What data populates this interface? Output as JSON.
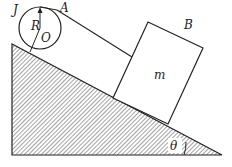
{
  "labels": {
    "J": "J",
    "R": "R",
    "O": "O",
    "A": "A",
    "B": "B",
    "m": "m",
    "theta": "θ"
  },
  "colors": {
    "line": "#222222",
    "hatch": "#333333",
    "background": "#ffffff"
  },
  "geometry": {
    "incline": {
      "top": [
        12,
        44
      ],
      "bottom_left": [
        12,
        155
      ],
      "right": [
        222,
        155
      ]
    },
    "disk": {
      "center": [
        40,
        28
      ],
      "radius": 21
    },
    "block": {
      "corners": [
        [
          113,
          98
        ],
        [
          148,
          22
        ],
        [
          203,
          48
        ],
        [
          168,
          124
        ]
      ]
    },
    "string": {
      "from": [
        57,
        10
      ],
      "to": [
        132,
        57
      ]
    }
  }
}
